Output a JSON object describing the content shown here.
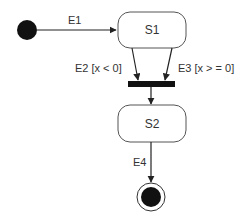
{
  "diagram": {
    "type": "state-machine",
    "colors": {
      "line": "#222222",
      "node_fill": "#111111",
      "state_border": "#555555",
      "state_fill": "#ffffff",
      "text": "#333333"
    },
    "initial": {
      "id": "initial"
    },
    "states": [
      {
        "id": "S1",
        "label": "S1"
      },
      {
        "id": "S2",
        "label": "S2"
      }
    ],
    "join_bar": {
      "id": "join"
    },
    "final": {
      "id": "final"
    },
    "transitions": [
      {
        "id": "t1",
        "from": "initial",
        "to": "S1",
        "label": "E1"
      },
      {
        "id": "t2",
        "from": "S1",
        "to": "join",
        "label": "E2 [x < 0]"
      },
      {
        "id": "t3",
        "from": "S1",
        "to": "join",
        "label": "E3 [x > = 0]"
      },
      {
        "id": "t4",
        "from": "join",
        "to": "S2",
        "label": ""
      },
      {
        "id": "t5",
        "from": "S2",
        "to": "final",
        "label": "E4"
      }
    ]
  }
}
